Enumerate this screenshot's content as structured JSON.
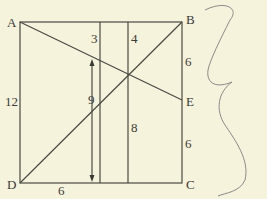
{
  "diagram": {
    "points": {
      "A": {
        "label": "A"
      },
      "B": {
        "label": "B"
      },
      "C": {
        "label": "C"
      },
      "D": {
        "label": "D"
      },
      "E": {
        "label": "E"
      }
    },
    "measurements": {
      "left_side": "12",
      "bottom_segment": "6",
      "top_middle_left": "3",
      "top_middle_right": "4",
      "arrow_height": "9",
      "inner_vertical": "8",
      "right_upper": "6",
      "right_lower": "6"
    },
    "colors": {
      "background": "#f6f3dd",
      "stroke": "#4a4a44",
      "scribble": "#8a8a88"
    }
  }
}
